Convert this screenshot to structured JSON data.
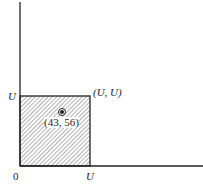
{
  "diagram": {
    "axis_origin_label": "0",
    "x_tick_label": "U",
    "y_tick_label": "U",
    "corner_label": "(U, U)",
    "point_label": "(43, 56)",
    "point": {
      "x": 43,
      "y": 56
    },
    "region": {
      "x_min": 0,
      "x_max": "U",
      "y_min": 0,
      "y_max": "U",
      "fill": "hatched"
    },
    "colors": {
      "line": "#222222",
      "hatch": "#555555",
      "background": "#ffffff"
    }
  }
}
